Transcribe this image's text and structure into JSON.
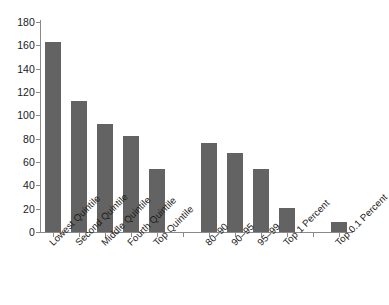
{
  "chart_data": {
    "type": "bar",
    "title": "",
    "subtitle": "",
    "xlabel": "",
    "ylabel": "",
    "ylim": [
      0,
      180
    ],
    "grid": false,
    "legend": null,
    "bar_color": "#636363",
    "axis_color": "#8a8a8a",
    "text_color": "#1a1a1a",
    "background": "#ffffff",
    "label_rotation": -45,
    "y_ticks": [
      0,
      20,
      40,
      60,
      80,
      100,
      120,
      140,
      160,
      180
    ],
    "y_tick_labels": [
      "0",
      "20",
      "40",
      "60",
      "80",
      "100",
      "120",
      "140",
      "160",
      "180"
    ],
    "categories": [
      "Lowest Quintile",
      "Second Quintile",
      "Middle Quintile",
      "Fourth Quintile",
      "Top Quintile",
      "",
      "80–90",
      "90–95",
      "95–99",
      "Top 1 Percent",
      "",
      "Top 0.1 Percent"
    ],
    "values": [
      163,
      112,
      93,
      82,
      54,
      null,
      76,
      68,
      54,
      21,
      null,
      9
    ],
    "bars": [
      {
        "category": "Lowest Quintile",
        "value": 163
      },
      {
        "category": "Second Quintile",
        "value": 112
      },
      {
        "category": "Middle Quintile",
        "value": 93
      },
      {
        "category": "Fourth Quintile",
        "value": 82
      },
      {
        "category": "Top Quintile",
        "value": 54
      },
      {
        "category": "",
        "value": null
      },
      {
        "category": "80–90",
        "value": 76
      },
      {
        "category": "90–95",
        "value": 68
      },
      {
        "category": "95–99",
        "value": 54
      },
      {
        "category": "Top 1 Percent",
        "value": 21
      },
      {
        "category": "",
        "value": null
      },
      {
        "category": "Top 0.1 Percent",
        "value": 9
      }
    ]
  }
}
